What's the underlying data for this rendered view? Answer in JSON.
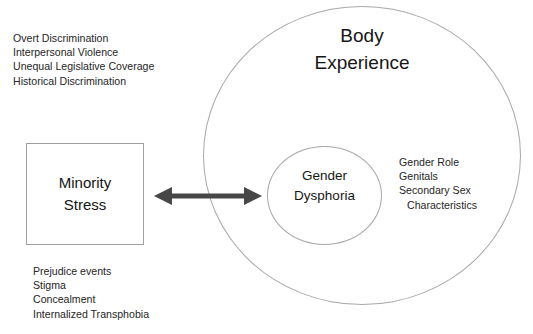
{
  "diagram": {
    "outer_circle": {
      "label": "Body\nExperience"
    },
    "inner_circle": {
      "label": "Gender\nDysphoria"
    },
    "box": {
      "label": "Minority\nStress"
    },
    "connector": {
      "name": "bidirectional-arrow",
      "color": "#474747"
    },
    "notes": {
      "top_left": {
        "lines": [
          "Overt Discrimination",
          "Interpersonal Violence",
          "Unequal Legislative Coverage",
          "Historical Discrimination"
        ]
      },
      "bottom_left": {
        "lines": [
          "Prejudice events",
          "Stigma",
          "Concealment",
          "Internalized Transphobia"
        ]
      },
      "right": {
        "lines": [
          "Gender Role",
          "Genitals",
          "Secondary Sex",
          "Characteristics"
        ]
      }
    },
    "colors": {
      "background": "#ffffff",
      "stroke": "#a8a8a8",
      "text": "#161616",
      "arrow": "#474747"
    }
  }
}
